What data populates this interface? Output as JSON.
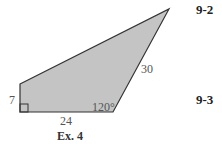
{
  "figure": {
    "caption": "Ex. 4",
    "fill_color": "#c4c4c4",
    "stroke_color": "#333333",
    "labels": {
      "left_side": "7",
      "bottom_side": "24",
      "slant_side": "30",
      "angle": "120°"
    }
  },
  "margin": {
    "sections": [
      "9-2",
      "9-3"
    ]
  }
}
